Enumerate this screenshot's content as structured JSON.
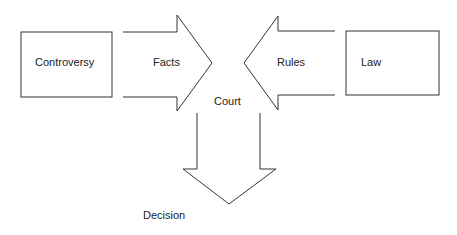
{
  "diagram": {
    "nodes": {
      "controversy": {
        "label": "Controversy",
        "shape": "rectangle"
      },
      "facts": {
        "label": "Facts",
        "shape": "arrow-right"
      },
      "court": {
        "label": "Court",
        "shape": "text"
      },
      "rules": {
        "label": "Rules",
        "shape": "arrow-left"
      },
      "law": {
        "label": "Law",
        "shape": "rectangle"
      },
      "decision": {
        "label": "Decision",
        "shape": "arrow-down"
      }
    },
    "edges": [
      {
        "from": "controversy",
        "to": "court",
        "label": "Facts"
      },
      {
        "from": "law",
        "to": "court",
        "label": "Rules"
      },
      {
        "from": "court",
        "to": "decision",
        "label": ""
      }
    ],
    "colors": {
      "stroke": "#333333",
      "background": "#ffffff",
      "text": "#222222"
    }
  }
}
